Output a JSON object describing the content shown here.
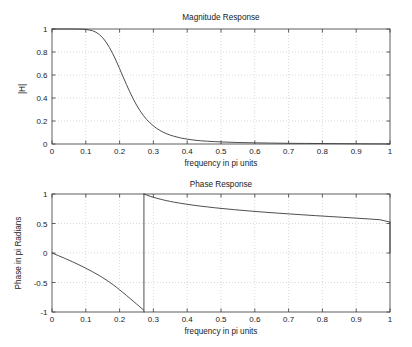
{
  "figure": {
    "width": 412,
    "height": 347,
    "background": "#ffffff",
    "axis_color": "#4d4d4d",
    "grid_color": "#c8c8c8",
    "curve_color": "#3a3a3a"
  },
  "chart_data": [
    {
      "id": "magnitude-response",
      "type": "line",
      "title": "Magnitude Response",
      "xlabel": "frequency in pi units",
      "ylabel": "|H|",
      "xlim": [
        0,
        1
      ],
      "ylim": [
        0,
        1
      ],
      "grid": true,
      "legend": "none",
      "xticks": [
        0,
        0.1,
        0.2,
        0.3,
        0.4,
        0.5,
        0.6,
        0.7,
        0.8,
        0.9,
        1
      ],
      "xticklabels": [
        "0",
        "0.1",
        "0.2",
        "0.3",
        "0.4",
        "0.5",
        "0.6",
        "0.7",
        "0.8",
        "0.9",
        "1"
      ],
      "yticks": [
        0,
        0.2,
        0.4,
        0.6,
        0.8,
        1
      ],
      "yticklabels": [
        "0",
        "0.2",
        "0.4",
        "0.6",
        "0.8",
        "1"
      ],
      "plot_box": {
        "left": 52,
        "top": 29,
        "right": 390,
        "bottom": 144
      },
      "title_pos": {
        "x": 221,
        "y": 20
      },
      "xlabel_pos": {
        "x": 221,
        "y": 166
      },
      "ylabel_pos": {
        "x": 25,
        "y": 89
      },
      "series": [
        {
          "name": "|H|",
          "x": [
            0,
            0.02,
            0.04,
            0.06,
            0.08,
            0.1,
            0.12,
            0.13,
            0.14,
            0.15,
            0.16,
            0.17,
            0.18,
            0.19,
            0.2,
            0.21,
            0.22,
            0.23,
            0.24,
            0.25,
            0.26,
            0.27,
            0.28,
            0.29,
            0.3,
            0.31,
            0.32,
            0.33,
            0.34,
            0.35,
            0.36,
            0.38,
            0.4,
            0.42,
            0.44,
            0.46,
            0.48,
            0.5,
            0.55,
            0.6,
            0.65,
            0.7,
            0.75,
            0.8,
            0.85,
            0.9,
            0.95,
            1
          ],
          "y": [
            1,
            1,
            1,
            1,
            0.999,
            0.997,
            0.985,
            0.972,
            0.952,
            0.924,
            0.886,
            0.839,
            0.784,
            0.722,
            0.655,
            0.587,
            0.519,
            0.454,
            0.394,
            0.339,
            0.291,
            0.249,
            0.213,
            0.183,
            0.157,
            0.135,
            0.117,
            0.101,
            0.088,
            0.077,
            0.068,
            0.053,
            0.042,
            0.034,
            0.028,
            0.024,
            0.021,
            0.018,
            0.013,
            0.01,
            0.008,
            0.006,
            0.005,
            0.004,
            0.003,
            0.002,
            0.001,
            0.0005
          ]
        }
      ]
    },
    {
      "id": "phase-response",
      "type": "line",
      "title": "Phase Response",
      "xlabel": "frequency in pi units",
      "ylabel": "Phase in pi Radians",
      "xlim": [
        0,
        1
      ],
      "ylim": [
        -1,
        1
      ],
      "grid": true,
      "legend": "none",
      "xticks": [
        0,
        0.1,
        0.2,
        0.3,
        0.4,
        0.5,
        0.6,
        0.7,
        0.8,
        0.9,
        1
      ],
      "xticklabels": [
        "0",
        "0.1",
        "0.2",
        "0.3",
        "0.4",
        "0.5",
        "0.6",
        "0.7",
        "0.8",
        "0.9",
        "1"
      ],
      "yticks": [
        -1,
        -0.5,
        0,
        0.5,
        1
      ],
      "yticklabels": [
        "-1",
        "-0.5",
        "0",
        "0.5",
        "1"
      ],
      "plot_box": {
        "left": 52,
        "top": 194,
        "right": 390,
        "bottom": 312
      },
      "title_pos": {
        "x": 221,
        "y": 187
      },
      "xlabel_pos": {
        "x": 221,
        "y": 334
      },
      "ylabel_pos": {
        "x": 21,
        "y": 253
      },
      "discontinuity_x": 0.272,
      "series": [
        {
          "name": "phase-branch-1",
          "x": [
            0,
            0.02,
            0.04,
            0.06,
            0.08,
            0.1,
            0.12,
            0.14,
            0.15,
            0.16,
            0.17,
            0.18,
            0.19,
            0.2,
            0.21,
            0.22,
            0.23,
            0.24,
            0.25,
            0.26,
            0.27,
            0.272
          ],
          "y": [
            0,
            -0.047,
            -0.096,
            -0.147,
            -0.201,
            -0.258,
            -0.318,
            -0.383,
            -0.418,
            -0.455,
            -0.494,
            -0.535,
            -0.578,
            -0.623,
            -0.67,
            -0.718,
            -0.766,
            -0.815,
            -0.864,
            -0.913,
            -0.962,
            -0.973
          ]
        },
        {
          "name": "phase-branch-2",
          "x": [
            0.272,
            0.28,
            0.29,
            0.3,
            0.31,
            0.32,
            0.33,
            0.34,
            0.35,
            0.36,
            0.38,
            0.4,
            0.42,
            0.44,
            0.46,
            0.48,
            0.5,
            0.54,
            0.58,
            0.62,
            0.66,
            0.7,
            0.74,
            0.78,
            0.82,
            0.86,
            0.9,
            0.94,
            0.97,
            1
          ],
          "y": [
            1.0,
            0.982,
            0.962,
            0.944,
            0.928,
            0.913,
            0.899,
            0.886,
            0.874,
            0.863,
            0.843,
            0.825,
            0.809,
            0.794,
            0.781,
            0.768,
            0.756,
            0.734,
            0.714,
            0.696,
            0.679,
            0.663,
            0.648,
            0.633,
            0.619,
            0.605,
            0.591,
            0.576,
            0.564,
            0.524
          ]
        },
        {
          "name": "phase-endpoint-drop",
          "x": [
            1,
            1
          ],
          "y": [
            0.524,
            0.0
          ]
        }
      ]
    }
  ]
}
